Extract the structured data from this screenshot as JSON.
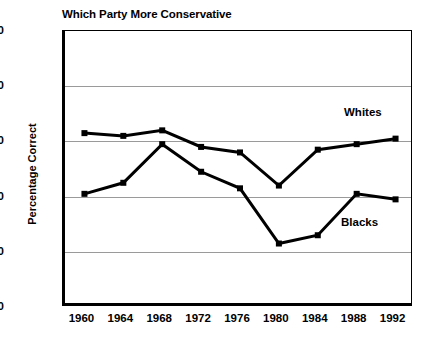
{
  "chart_data": {
    "type": "line",
    "title": "Which Party More Conservative",
    "xlabel": "",
    "ylabel": "Percentage Correct",
    "categories": [
      "1960",
      "1964",
      "1968",
      "1972",
      "1976",
      "1980",
      "1984",
      "1988",
      "1992"
    ],
    "x": [
      1960,
      1964,
      1968,
      1972,
      1976,
      1980,
      1984,
      1988,
      1992
    ],
    "series": [
      {
        "name": "Whites",
        "values": [
          63,
          62,
          64,
          58,
          56,
          44,
          57,
          59,
          61
        ],
        "color": "#000000",
        "marker": "square"
      },
      {
        "name": "Blacks",
        "values": [
          41,
          45,
          59,
          49,
          43,
          23,
          26,
          41,
          39
        ],
        "color": "#000000",
        "marker": "square"
      }
    ],
    "ylim": [
      0,
      100
    ],
    "y_ticks": [
      0,
      20,
      40,
      60,
      80,
      100
    ],
    "y_tick_labels": [
      "0",
      "20",
      "40",
      "60",
      "80",
      "100"
    ],
    "grid": "horizontal",
    "gridline_values": [
      20,
      40,
      60,
      80
    ],
    "legend": "inline-labels",
    "legend_position": "right-inside",
    "annotations": [
      {
        "text": "Whites",
        "series": "Whites"
      },
      {
        "text": "Blacks",
        "series": "Blacks"
      }
    ]
  }
}
